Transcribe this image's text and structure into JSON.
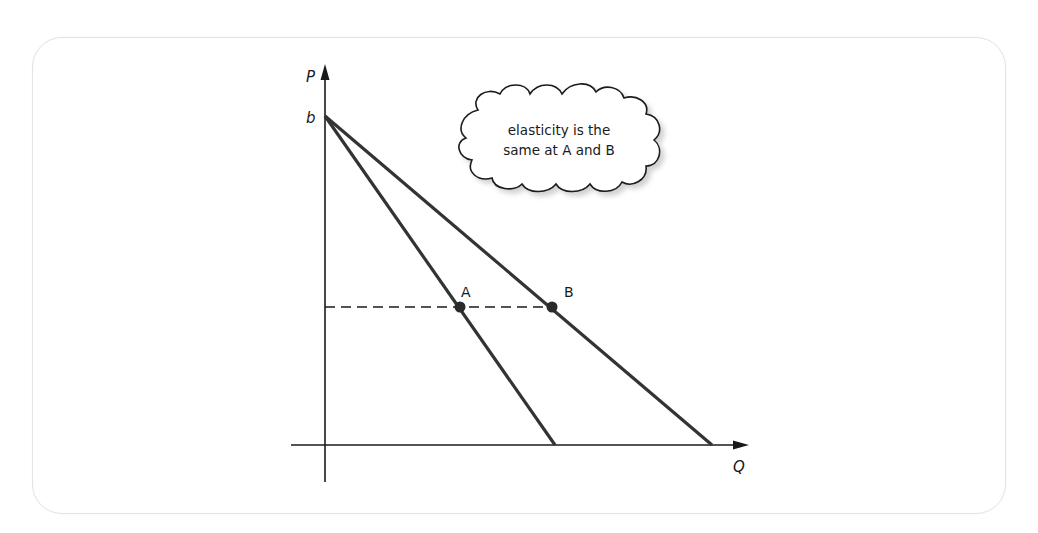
{
  "diagram": {
    "axes": {
      "y_label": "P",
      "x_label": "Q",
      "intercept_label": "b"
    },
    "points": [
      {
        "label": "A",
        "x": 460,
        "y": 307
      },
      {
        "label": "B",
        "x": 552,
        "y": 307
      }
    ],
    "curves": [
      {
        "name": "steep-demand",
        "from": [
          325,
          116
        ],
        "to": [
          555,
          445
        ]
      },
      {
        "name": "flat-demand",
        "from": [
          325,
          116
        ],
        "to": [
          712,
          445
        ]
      }
    ],
    "price_line": {
      "style": "dashed",
      "y": 307,
      "x_from": 325,
      "x_to": 552
    },
    "callout": {
      "line1": "elasticity is the",
      "line2": "same at A and B"
    },
    "colors": {
      "line": "#333333",
      "axis": "#1a1a1a",
      "point": "#2a2a2a",
      "frame": "#e3e3e3"
    }
  }
}
